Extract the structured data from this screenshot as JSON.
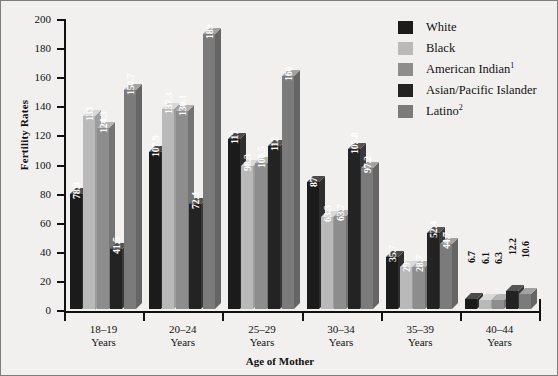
{
  "chart_data": {
    "type": "bar",
    "title": "",
    "xlabel": "Age of Mother",
    "ylabel": "Fertility Rates",
    "ylim": [
      0,
      200
    ],
    "ytick_step": 20,
    "yticks": [
      200,
      180,
      160,
      140,
      120,
      100,
      80,
      60,
      40,
      20,
      0
    ],
    "grid": false,
    "legend_position": "top-right",
    "categories": [
      "18–19\nYears",
      "20–24\nYears",
      "25–29\nYears",
      "30–34\nYears",
      "35–39\nYears",
      "40–44\nYears"
    ],
    "category_lines": [
      [
        "18–19",
        "Years"
      ],
      [
        "20–24",
        "Years"
      ],
      [
        "25–29",
        "Years"
      ],
      [
        "30–34",
        "Years"
      ],
      [
        "35–39",
        "Years"
      ],
      [
        "40–44",
        "Years"
      ]
    ],
    "series": [
      {
        "name": "White",
        "color": "#1b1b1b",
        "top_color": "#4a4a4a",
        "side_color": "#2e2e2e",
        "values": [
          78.8,
          107.9,
          117,
          87,
          35.7,
          6.7
        ],
        "labels": [
          "78.8",
          "107.9",
          "117",
          "87",
          "35.7",
          "6.7"
        ]
      },
      {
        "name": "Black",
        "color": "#b9b9b9",
        "top_color": "#d8d8d8",
        "side_color": "#9d9d9d",
        "values": [
          133,
          137.3,
          98.3,
          63.3,
          29,
          6.1
        ],
        "labels": [
          "133",
          "137.3",
          "98.3",
          "63.3",
          "29",
          "6.1"
        ]
      },
      {
        "name": "American Indian",
        "name_sup": "1",
        "color": "#8d8d8d",
        "top_color": "#b4b4b4",
        "side_color": "#747474",
        "values": [
          124.3,
          136.1,
          100.5,
          63.7,
          28.7,
          6.3
        ],
        "labels": [
          "124.3",
          "136.1",
          "100.5",
          "63.7",
          "28.7",
          "6.3"
        ]
      },
      {
        "name": "Asian/Pacific Islander",
        "color": "#232323",
        "top_color": "#555555",
        "side_color": "#383838",
        "values": [
          41.5,
          72.4,
          112,
          109.8,
          52.4,
          12.2
        ],
        "labels": [
          "41.5",
          "72.4",
          "112",
          "109.8",
          "52.4",
          "12.2"
        ]
      },
      {
        "name": "Latino",
        "name_sup": "2",
        "color": "#7b7b7b",
        "top_color": "#a2a2a2",
        "side_color": "#656565",
        "values": [
          150.7,
          189,
          160,
          97.2,
          44.7,
          10.6
        ],
        "labels": [
          "150.7",
          "189",
          "160",
          "97.2",
          "44.7",
          "10.6"
        ]
      }
    ]
  },
  "legend": {
    "items": [
      {
        "label": "White",
        "sup": "",
        "color": "#1b1b1b"
      },
      {
        "label": "Black",
        "sup": "",
        "color": "#b9b9b9"
      },
      {
        "label": "American Indian",
        "sup": "1",
        "color": "#8d8d8d"
      },
      {
        "label": "Asian/Pacific Islander",
        "sup": "",
        "color": "#232323"
      },
      {
        "label": "Latino",
        "sup": "2",
        "color": "#7b7b7b"
      }
    ]
  }
}
